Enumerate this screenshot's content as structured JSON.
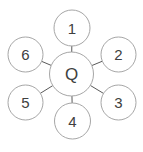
{
  "diagram": {
    "type": "hub-and-spoke",
    "colors": {
      "node_fill": "#ffffff",
      "node_stroke": "#a6a6a6",
      "edge": "#595959",
      "text": "#404040"
    },
    "center": {
      "label": "Q",
      "cx": 71.5,
      "cy": 74,
      "r": 22
    },
    "satellites": [
      {
        "label": "1",
        "cx": 72,
        "cy": 28,
        "r": 18
      },
      {
        "label": "2",
        "cx": 118.5,
        "cy": 54.5,
        "r": 17.5
      },
      {
        "label": "3",
        "cx": 118.5,
        "cy": 102.5,
        "r": 17.5
      },
      {
        "label": "4",
        "cx": 72.5,
        "cy": 121,
        "r": 18
      },
      {
        "label": "5",
        "cx": 25.5,
        "cy": 102.5,
        "r": 17.5
      },
      {
        "label": "6",
        "cx": 25.5,
        "cy": 54.5,
        "r": 17.5
      }
    ]
  }
}
